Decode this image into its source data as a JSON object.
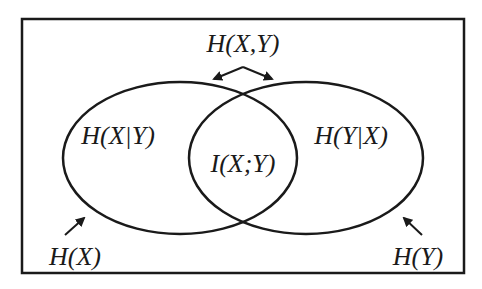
{
  "diagram": {
    "title_label": "H(X,Y)",
    "left_region_label": "H(X|Y)",
    "center_region_label": "I(X;Y)",
    "right_region_label": "H(Y|X)",
    "left_set_label": "H(X)",
    "right_set_label": "H(Y)",
    "stroke_color": "#1a1a1a",
    "background": "#ffffff"
  }
}
